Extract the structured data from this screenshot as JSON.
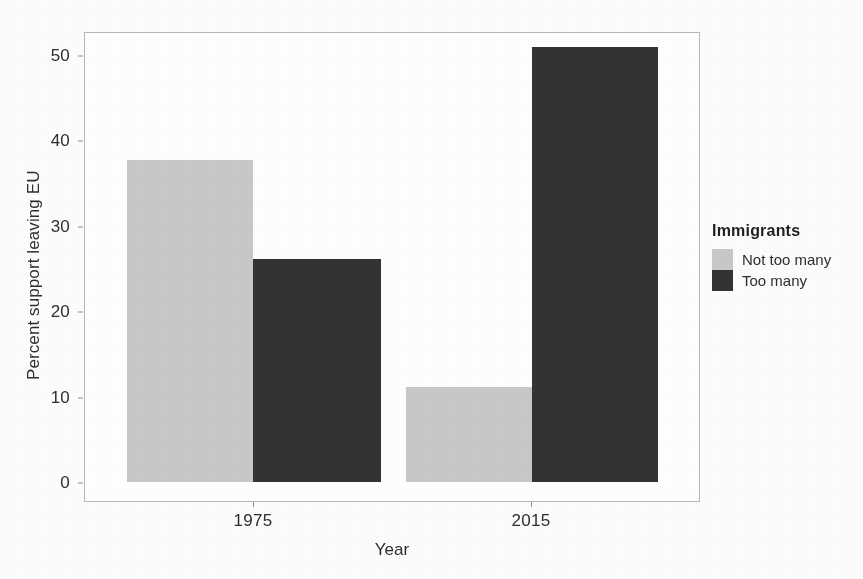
{
  "chart_data": {
    "type": "bar",
    "title": "",
    "subtitle": "",
    "xlabel": "Year",
    "ylabel": "Percent support leaving EU",
    "categories": [
      "1975",
      "2015"
    ],
    "series": [
      {
        "name": "Not too many",
        "values": [
          37.7,
          11.1
        ],
        "color": "#c9c9c9"
      },
      {
        "name": "Too many",
        "values": [
          26.1,
          50.9
        ],
        "color": "#333333"
      }
    ],
    "ylim": [
      0,
      53
    ],
    "yticks": [
      0,
      10,
      20,
      30,
      40,
      50
    ],
    "ytick_labels": [
      "0",
      "10",
      "20",
      "30",
      "40",
      "50"
    ],
    "xtick_labels": [
      "1975",
      "2015"
    ],
    "grid": false,
    "legend": {
      "title": "Immigrants",
      "position": "right",
      "entries": [
        {
          "label": "Not too many",
          "color": "#c9c9c9"
        },
        {
          "label": "Too many",
          "color": "#333333"
        }
      ]
    },
    "panel_border_color": "#b9b9b9",
    "background_color": "#ffffff"
  }
}
